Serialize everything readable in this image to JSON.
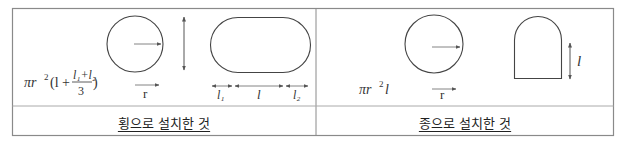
{
  "table": {
    "columns": [
      {
        "caption": "횡으로 설치한 것",
        "formula": {
          "prefix": "πr",
          "exp": "2",
          "open": "(l +",
          "numerator": "l₁+l₂",
          "denominator": "3",
          "close": ")"
        },
        "radius_label": "r",
        "dimension_labels": [
          "l₁",
          "l",
          "l₂"
        ]
      },
      {
        "caption": "종으로 설치한 것",
        "formula": {
          "prefix": "πr",
          "exp": "2",
          "suffix": "l"
        },
        "radius_label": "r",
        "height_label": "l"
      }
    ]
  },
  "colors": {
    "border": "#8a8a8a",
    "stroke": "#444444",
    "arrow": "#555555"
  }
}
